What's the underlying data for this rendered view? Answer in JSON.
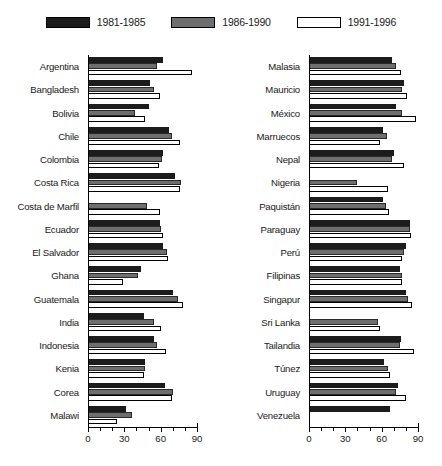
{
  "chart_data": {
    "type": "bar",
    "title": "",
    "xlabel": "",
    "ylabel": "",
    "orientation": "horizontal",
    "xlim": [
      0,
      90
    ],
    "xticks": [
      0,
      30,
      60,
      90
    ],
    "xtick_labels": [
      "0",
      "30",
      "60",
      "90"
    ],
    "minor_tick_step": 10,
    "grid": false,
    "legend_position": "top-center",
    "legend": [
      "1981-1985",
      "1986-1990",
      "1991-1996"
    ],
    "series": [
      {
        "name": "1981-1985",
        "color": "#1c1c1c"
      },
      {
        "name": "1986-1990",
        "color": "#6e6e6e"
      },
      {
        "name": "1991-1996",
        "color": "#ffffff"
      }
    ],
    "panels": [
      {
        "name": "left-panel",
        "categories": [
          "Argentina",
          "Bangladesh",
          "Bolivia",
          "Chile",
          "Colombia",
          "Costa Rica",
          "Costa de Marfil",
          "Ecuador",
          "El Salvador",
          "Ghana",
          "Guatemala",
          "India",
          "Indonesia",
          "Kenia",
          "Corea",
          "Malawi"
        ],
        "values": {
          "1981-1985": [
            62,
            51,
            50,
            67,
            62,
            72,
            0,
            59,
            62,
            43,
            70,
            46,
            54,
            47,
            63,
            31
          ],
          "1986-1990": [
            57,
            54,
            38,
            69,
            61,
            77,
            48,
            60,
            65,
            41,
            74,
            54,
            57,
            47,
            70,
            36
          ],
          "1991-1996": [
            86,
            59,
            47,
            76,
            58,
            76,
            59,
            62,
            66,
            28,
            78,
            60,
            64,
            46,
            69,
            23
          ]
        }
      },
      {
        "name": "right-panel",
        "categories": [
          "Malasia",
          "Mauricio",
          "México",
          "Marruecos",
          "Nepal",
          "Nigeria",
          "Paquistán",
          "Paraguay",
          "Perú",
          "Filipinas",
          "Singapur",
          "Sri Lanka",
          "Tailandia",
          "Túnez",
          "Uruguay",
          "Venezuela"
        ],
        "values": {
          "1981-1985": [
            68,
            78,
            72,
            61,
            70,
            0,
            61,
            83,
            80,
            75,
            80,
            0,
            76,
            62,
            73,
            67
          ],
          "1986-1990": [
            72,
            77,
            77,
            64,
            68,
            39,
            63,
            83,
            78,
            77,
            82,
            57,
            75,
            65,
            72,
            0
          ],
          "1991-1996": [
            76,
            81,
            88,
            58,
            78,
            65,
            66,
            84,
            77,
            77,
            85,
            58,
            87,
            67,
            80,
            0
          ]
        }
      }
    ]
  }
}
